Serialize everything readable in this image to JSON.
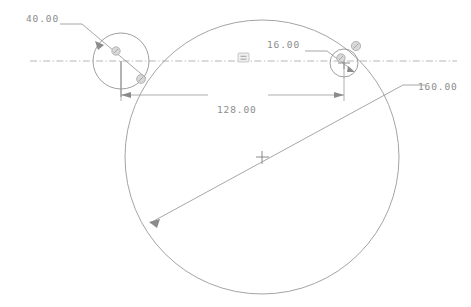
{
  "drawing": {
    "title": "CAD Sketch",
    "background_color": "#ffffff",
    "line_color": "#8e8e8e",
    "dimension_color": "#8c8c8c",
    "width": 471,
    "height": 307
  },
  "dimensions": [
    {
      "id": "dia-left-circle",
      "label": "40.00",
      "value": 40.0,
      "kind": "diameter",
      "text_x": 26,
      "text_y": 22
    },
    {
      "id": "dia-right-circle",
      "label": "16.00",
      "value": 16.0,
      "kind": "diameter",
      "text_x": 267,
      "text_y": 48
    },
    {
      "id": "center-distance",
      "label": "128.00",
      "value": 128.0,
      "kind": "linear",
      "text_x": 217,
      "text_y": 113
    },
    {
      "id": "dia-big-circle",
      "label": "160.00",
      "value": 160.0,
      "kind": "diameter",
      "text_x": 418,
      "text_y": 90
    }
  ],
  "entities": {
    "big_circle": {
      "cx": 262,
      "cy": 157,
      "r": 137
    },
    "left_circle": {
      "cx": 121,
      "cy": 61,
      "r": 28
    },
    "right_circle": {
      "cx": 344,
      "cy": 63,
      "r": 14
    },
    "centerline": {
      "x1": 30,
      "y1": 61,
      "x2": 457,
      "y2": 61
    }
  },
  "constraints": [
    {
      "id": "equal-mark",
      "glyph": "equal-icon",
      "x": 243,
      "y": 58
    },
    {
      "id": "tangent-left",
      "glyph": "tangent-icon",
      "x": 140,
      "y": 79
    },
    {
      "id": "coincident-left",
      "glyph": "coincident-icon",
      "x": 115,
      "y": 52
    },
    {
      "id": "coincident-right",
      "glyph": "coincident-icon",
      "x": 341,
      "y": 58
    },
    {
      "id": "tangent-right",
      "glyph": "tangent-icon",
      "x": 355,
      "y": 46
    }
  ]
}
